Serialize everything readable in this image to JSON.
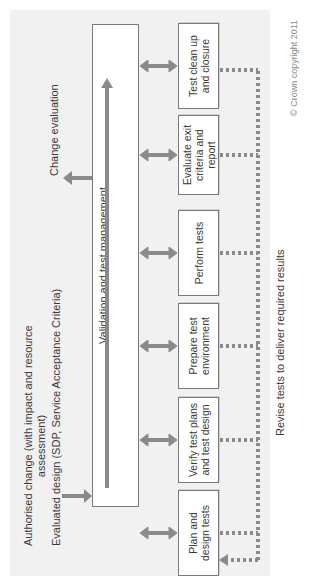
{
  "diagram": {
    "inputs": {
      "authorised_change_line1": "Authorised change (with impact and resource",
      "authorised_change_line2": "assessment)",
      "evaluated_design": "Evaluated design (SDP, Service Acceptance Criteria)"
    },
    "output": "Change evaluation",
    "main_box": "Validation and test management",
    "steps": [
      {
        "line1": "Plan and",
        "line2": "design tests"
      },
      {
        "line1": "Verify test plans",
        "line2": "and test design"
      },
      {
        "line1": "Prepare test",
        "line2": "environment"
      },
      {
        "line1": "Perform tests",
        "line2": ""
      },
      {
        "line1": "Evaluate exit",
        "line2": "criteria and report"
      },
      {
        "line1": "Test clean up",
        "line2": "and closure"
      }
    ],
    "feedback_label": "Revise tests to deliver required results",
    "copyright": "© Crown copyright 2011"
  },
  "colors": {
    "arrow": "#8a8a8a",
    "border": "#7a7a7a",
    "panel": "#f1f1f1",
    "text": "#3a3a3a"
  }
}
